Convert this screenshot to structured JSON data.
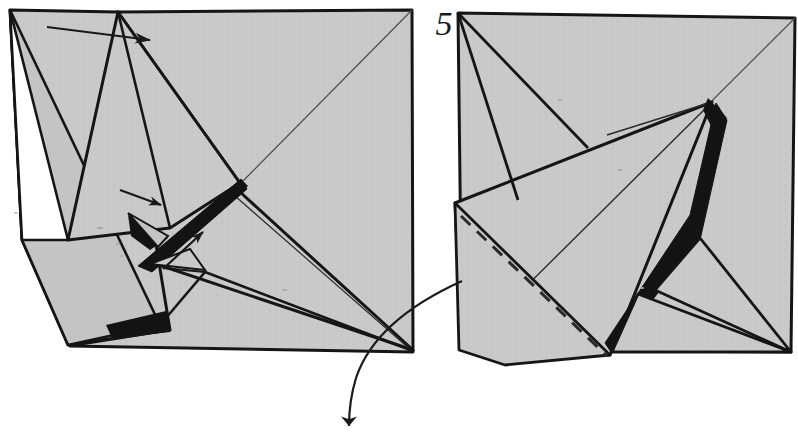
{
  "diagram": {
    "kind": "origami-folding-instruction",
    "step_label": "5",
    "panel_count": 2,
    "paper_fill": "#c9c9c9",
    "paper_fill_shade": "#bdbdbd",
    "ink": "#151515",
    "hidden_fold": "#2a2a2a",
    "background": "#ffffff",
    "panels": [
      {
        "name": "left-panel",
        "description": "partly-folded square with raised flap on left and black crease bands",
        "outline": "10,10 68,345 415,352 412,10",
        "line_kind": "solid-valley-and-edge"
      },
      {
        "name": "right-panel",
        "description": "square with swung-over point, black gusset band and dashed hidden fold",
        "outline": "458,13 795,18 790,352 458,350",
        "line_kind": "solid-with-dashed-hidden-fold"
      }
    ],
    "arrows": [
      {
        "name": "fold-arrow-top",
        "style": "straight",
        "direction": "right",
        "from": "47,27",
        "to": "150,40"
      },
      {
        "name": "fold-arrow-mid-upper",
        "style": "straight",
        "direction": "right",
        "from": "120,190",
        "to": "160,204"
      },
      {
        "name": "fold-arrow-mid-lower",
        "style": "straight",
        "direction": "up",
        "from": "163,268",
        "to": "203,231"
      },
      {
        "name": "transition-arrow",
        "style": "curved",
        "direction": "down",
        "from": "460,281",
        "to": "350,434"
      }
    ],
    "legend": {
      "solid_line": "edge or existing crease",
      "dashed_line": "hidden edge behind the paper",
      "black_region": "reverse side of paper seen in gusset",
      "arrow": "direction to fold / next step"
    }
  }
}
